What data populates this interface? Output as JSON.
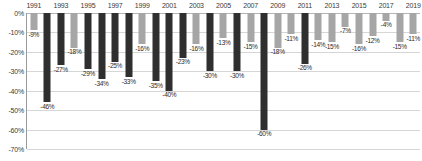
{
  "chart_data": {
    "type": "bar",
    "title": "",
    "subtitle": "",
    "xlabel": "",
    "ylabel": "",
    "ylim": [
      -70,
      0
    ],
    "grid": true,
    "legend": false,
    "y_ticks": [
      "0%",
      "-10%",
      "-20%",
      "-30%",
      "-40%",
      "-50%",
      "-60%",
      "-70%"
    ],
    "y_tick_values": [
      0,
      -10,
      -20,
      -30,
      -40,
      -50,
      -60,
      -70
    ],
    "x_tick_labels": [
      "1991",
      "1993",
      "1995",
      "1997",
      "1999",
      "2001",
      "2003",
      "2005",
      "2007",
      "2009",
      "2011",
      "2013",
      "2015",
      "2017",
      "2019"
    ],
    "categories": [
      "1991",
      "1992",
      "1993",
      "1994",
      "1995",
      "1996",
      "1997",
      "1998",
      "1999",
      "2000",
      "2001",
      "2002",
      "2003",
      "2004",
      "2005",
      "2006",
      "2007",
      "2008",
      "2009",
      "2010",
      "2011",
      "2012",
      "2013",
      "2014",
      "2015",
      "2016",
      "2017",
      "2018",
      "2019"
    ],
    "values": [
      -9,
      -46,
      -27,
      -18,
      -29,
      -34,
      -25,
      -33,
      -16,
      -35,
      -40,
      -23,
      -16,
      -30,
      -13,
      -30,
      -15,
      -60,
      -18,
      -11,
      -26,
      -14,
      -15,
      -7,
      -16,
      -12,
      -4,
      -15,
      -11
    ],
    "data_labels": [
      "-9%",
      "-46%",
      "-27%",
      "-18%",
      "-29%",
      "-34%",
      "-25%",
      "-33%",
      "-16%",
      "-35%",
      "-40%",
      "-23%",
      "-16%",
      "-30%",
      "-13%",
      "-30%",
      "-15%",
      "-60%",
      "-18%",
      "-11%",
      "-26%",
      "-14%",
      "-15%",
      "-7%",
      "-16%",
      "-12%",
      "-4%",
      "-15%",
      "-11%"
    ],
    "bar_colors": [
      "light",
      "dark",
      "dark",
      "light",
      "dark",
      "dark",
      "dark",
      "dark",
      "light",
      "dark",
      "dark",
      "dark",
      "light",
      "dark",
      "light",
      "dark",
      "light",
      "dark",
      "light",
      "light",
      "dark",
      "light",
      "light",
      "light",
      "light",
      "light",
      "light",
      "light",
      "light"
    ],
    "colors": {
      "bar_light": "#a6a6a6",
      "bar_dark": "#2f2f2f",
      "gridline": "#d6d6d6",
      "axis": "#9a9a9a",
      "text": "#3a3a3a",
      "background": "#ffffff"
    }
  }
}
